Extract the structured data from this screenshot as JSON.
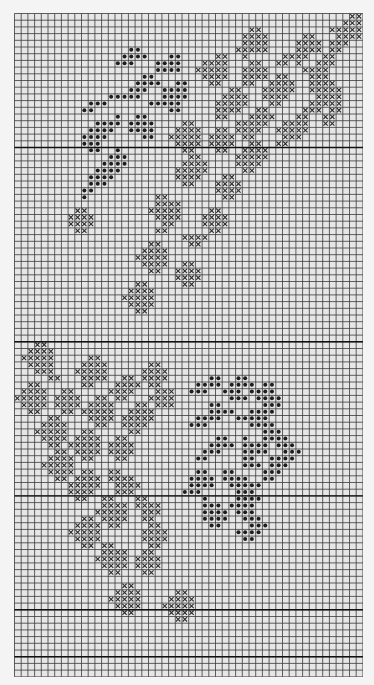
{
  "chart": {
    "type": "cross-stitch-pattern",
    "cols": 52,
    "rows": 99,
    "cell_px": 6.7,
    "bold_line_rows": [
      20,
      49,
      72,
      89,
      96
    ],
    "colors": {
      "background": "#f4f4f4",
      "cell_fill": "#e6e6e6",
      "grid_line": "#3a3a3a",
      "bold_line": "#111111",
      "cross": "#2c2c2c",
      "bead": "#1e1e1e"
    },
    "legend": {
      "cross_symbol": "X",
      "bead_symbol": "●",
      "empty_symbol": "."
    }
  },
  "chart_data": {
    "type": "heatmap",
    "title": "",
    "grid": [
      "..................................................XX",
      ".................................................XXXX",
      "...................................XX..........XXXXX.",
      "..................................XXXX.....XX...XXXXX.",
      "..................................XXXX....XXXX.XXX...",
      ".................●●..............XXXXX....XXXX.XX....",
      "................●●●●...●●.....XX..X.....XXXX..XX....",
      "...............●●●...●●●●...XXXX...XX..XX.X..XXX...",
      ".....................●●●●..XXXXX..XXXX.....XXXX....",
      "...................●●.......XXXX..XXXX.XX...XXX....",
      "..................●●●●..●●...XX...XX..XXXX..XXXX...",
      ".................●●●..●●●●......XX...XXXXX..XXXXX..",
      "..............●●●●●...●●●●.....XXXX..XXXX....XXXX..",
      "...........●●●......●●●●●.....XXXXX...XX....XXXXX..",
      "..........●●...........●●.....XXXX..XX.....XXX.XX..",
      "...............●..●●..........XX...XXXX...XX..XX...",
      "............●●●●.●●●●....XX......XXXXX..XXXX..XX...",
      "...........●●●●..●●●●...XXXX..XX.XXXX..XXXXX......",
      "..........●●●●.....●●..XXXXX.XXXX.XX....XXX.......",
      "..........●●●...........XXXX.XXXX..XX..XX.........",
      "...........●●..●.........XX...XX..XXXX............",
      "..............●●●.........XX.....XXXXX............",
      ".............●●●●........XXXX....XXXX.............",
      "............●●●●........XXXXX.....XX..............",
      "...........●●●●.........XXXX...XX.................",
      "...........●●●...........XX...XXXX................",
      "..........●●..................XXXX................",
      "..........●..........XX........XX.................",
      ".....................XXXX.........................",
      ".........XX.........XXXXX....XX...................",
      "........XXXX.........XXXX...XXXX..................",
      "........XXXX..........XX....XXXX..................",
      ".........XX..........XX......XX...................",
      ".........................XXXX.....................",
      "....................XX....XX......................",
      "...................XXXX...........................",
      "..................XXXXX...........................",
      "...................XXXX..XX.......................",
      "....................XX..XXXX......................",
      "........................XXXX......................",
      "..................XX.....XX.......................",
      ".................XXXX.............................",
      "................XXXXX.............................",
      ".................XXXX.............................",
      "..................XX..............................",
      "....................................................",
      "....................................................",
      "....................................................",
      "....................................................",
      "...XX...............................................",
      "..XXXX..............................................",
      ".XXXXX.....XX.....................................",
      "..XXXX....XXXX......XX............................",
      "...XXX...XXXXX.....XXXX...........................",
      ".....XX...XXXX..XX.XXXX......●●..●●...............",
      "..XX......XX...XXXX.XX.....●●●●.●●●●.●●...........",
      ".XXXX..XX.....XXXX...XXX..●●●..●●●.●●●●..........",
      "XXXXX.XXXX..XX.XX...XXXX........●●●.●●●●.........",
      ".XXXX.XXXX.XXXX...XX.XXX.....●●......●●●.........",
      "..XX...XX.XXXXX..XXXX........●●●●..●●●●..........",
      ".....XX....XXXX.XXXXX......●●●●..●●●●●...........",
      "....XXXX....XX..XXXX......●●●......●●●●..........",
      "...XXXXX..XX.....XX..................●●●.........",
      "....XXXX.XXXX..XX.............●●..●..●●●●........",
      ".....XX.XXXXX.XXXX...........●●●●.●●●●.●●●........",
      "......XX.XXXX.XXXX..........●●●...●●●●..●●●.......",
      ".....XXXX.XX...XX..........●●.....●●..●●●●.......",
      "....XXXXX.........................●●●.●●●........",
      ".....XXXX.XX..XX...........●●..●●....●●●.........",
      "......XX.XXXX.XXXX........●●●●.●●●●..●●..........",
      "........XXXXX..XXXX.......●●●●..●●●●●...........",
      "........XXXX...XXX.......●●●.....●●●............",
      ".........XX..XX...XX........●....●●●●............",
      ".............XXXX.XXXX......●●●.●●●●.............",
      "............XXXXX..XXX......●●●●.●●●.............",
      "..........XX.XXXX..XX.......●●●●..●●●............",
      ".........XXXX.XX....XX.......●●....●●●...........",
      "........XXXXX......XXXX..........●●●●...........",
      ".........XXXX......XXXX...........●●............",
      "..........XX.XX.....XX..........................",
      ".............XXXX..XX...........................",
      "............XXXXX.XXXX..........................",
      ".............XXXX.XXXX..........................",
      "..............XX...XX...........................",
      "....................................................",
      "................XX..............................",
      "...............XXXX.....XX......................",
      "..............XXXXX....XXXX.....................",
      "...............XXXX...XXXXX.....................",
      "................XX.....XXXX.....................",
      "........................XX......................",
      "....................................................",
      "....................................................",
      "....................................................",
      "....................................................",
      "....................................................",
      "....................................................",
      "...................................................."
    ],
    "legend": [
      {
        "symbol": "X",
        "meaning": "cross stitch"
      },
      {
        "symbol": "●",
        "meaning": "bead / dot stitch"
      }
    ],
    "grid_on": true
  }
}
